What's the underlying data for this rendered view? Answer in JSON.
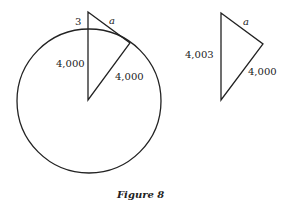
{
  "figure": {
    "caption": "Figure 8",
    "left_diagram": {
      "labels": {
        "small_segment": "3",
        "tangent": "a",
        "vertical_radius": "4,000",
        "slanted_radius": "4,000"
      }
    },
    "right_diagram": {
      "labels": {
        "tangent": "a",
        "vertical_side": "4,003",
        "slanted_side": "4,000"
      }
    }
  }
}
